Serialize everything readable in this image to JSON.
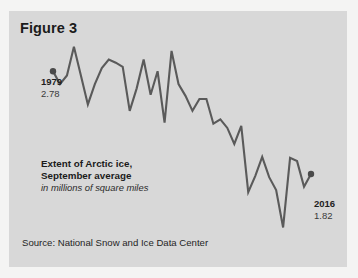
{
  "figure": {
    "title": "Figure 3",
    "source": "Source: National Snow and Ice Data Center",
    "panel_color": "#d8d8d8",
    "background_color": "#f4f4f3",
    "line_color": "#5a5a5a",
    "marker_color": "#4a4a4a"
  },
  "annotations": {
    "start_year": "1979",
    "start_value": "2.78",
    "end_year": "2016",
    "end_value": "1.82",
    "series_title_line1": "Extent of Arctic ice,",
    "series_title_line2": "September average",
    "series_subtitle": "in millions of square miles"
  },
  "chart_data": {
    "type": "line",
    "title": "Extent of Arctic ice, September average",
    "subtitle": "in millions of square miles",
    "xlabel": "",
    "ylabel": "millions of square miles",
    "grid": false,
    "legend": null,
    "xlim": [
      1979,
      2016
    ],
    "ylim": [
      1.1,
      3.1
    ],
    "x": [
      1979,
      1980,
      1981,
      1982,
      1983,
      1984,
      1985,
      1986,
      1987,
      1988,
      1989,
      1990,
      1991,
      1992,
      1993,
      1994,
      1995,
      1996,
      1997,
      1998,
      1999,
      2000,
      2001,
      2002,
      2003,
      2004,
      2005,
      2006,
      2007,
      2008,
      2009,
      2010,
      2011,
      2012,
      2013,
      2014,
      2015,
      2016
    ],
    "values": [
      2.78,
      2.66,
      2.74,
      3.01,
      2.74,
      2.47,
      2.66,
      2.81,
      2.89,
      2.86,
      2.82,
      2.41,
      2.62,
      2.89,
      2.56,
      2.78,
      2.3,
      2.97,
      2.66,
      2.55,
      2.41,
      2.52,
      2.52,
      2.29,
      2.33,
      2.25,
      2.1,
      2.27,
      1.65,
      1.8,
      1.98,
      1.79,
      1.67,
      1.32,
      1.97,
      1.94,
      1.7,
      1.82
    ],
    "annotations": [
      {
        "year": 1979,
        "value": 2.78,
        "label": "1979 / 2.78",
        "marker": true
      },
      {
        "year": 2016,
        "value": 1.82,
        "label": "2016 / 1.82",
        "marker": true
      }
    ]
  }
}
